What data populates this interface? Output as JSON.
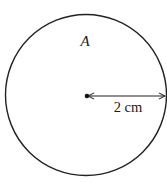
{
  "diagram": {
    "type": "circle-with-radius",
    "circle_label": "A",
    "radius_label": "2 cm",
    "stroke_color": "#222222",
    "background": "#ffffff"
  }
}
